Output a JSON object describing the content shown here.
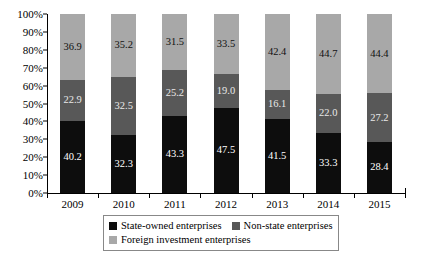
{
  "chart_data": {
    "type": "bar",
    "subtype": "stacked-percent",
    "title": "",
    "xlabel": "",
    "ylabel": "",
    "ylim": [
      0,
      100
    ],
    "ytick_labels": [
      "0%",
      "10%",
      "20%",
      "30%",
      "40%",
      "50%",
      "60%",
      "70%",
      "80%",
      "90%",
      "100%"
    ],
    "ytick_values": [
      0,
      10,
      20,
      30,
      40,
      50,
      60,
      70,
      80,
      90,
      100
    ],
    "grid": false,
    "legend_position": "bottom",
    "categories": [
      "2009",
      "2010",
      "2011",
      "2012",
      "2013",
      "2014",
      "2015"
    ],
    "series": [
      {
        "name": "State-owned enterprises",
        "color": "#0d0d0d",
        "values": [
          40.2,
          32.3,
          43.3,
          47.5,
          41.5,
          33.3,
          28.4
        ],
        "labels": [
          "40.2",
          "32.3",
          "43.3",
          "47.5",
          "41.5",
          "33.3",
          "28.4"
        ]
      },
      {
        "name": "Non-state enterprises",
        "color": "#585858",
        "values": [
          22.9,
          32.5,
          25.2,
          19.0,
          16.1,
          22.0,
          27.2
        ],
        "labels": [
          "22.9",
          "32.5",
          "25.2",
          "19.0",
          "16.1",
          "22.0",
          "27.2"
        ]
      },
      {
        "name": "Foreign investment enterprises",
        "color": "#a8a8a8",
        "values": [
          36.9,
          35.2,
          31.5,
          33.5,
          42.4,
          44.7,
          44.4
        ],
        "labels": [
          "36.9",
          "35.2",
          "31.5",
          "33.5",
          "42.4",
          "44.7",
          "44.4"
        ]
      }
    ]
  },
  "legend": {
    "items": [
      {
        "label": "State-owned enterprises",
        "swatch_class": "sw-state"
      },
      {
        "label": "Non-state enterprises",
        "swatch_class": "sw-nonstate"
      },
      {
        "label": "Foreign investment enterprises",
        "swatch_class": "sw-foreign"
      }
    ]
  }
}
